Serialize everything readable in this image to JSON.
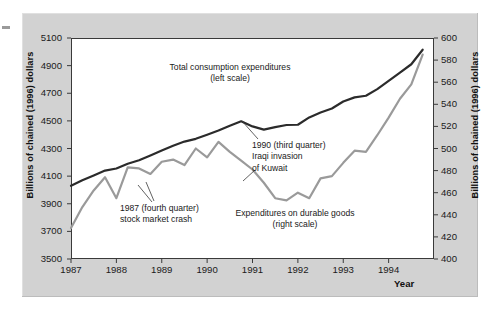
{
  "chart_data": {
    "type": "line",
    "title": "",
    "xlabel": "Year",
    "ylabel_left": "Billions of chained (1996) dollars",
    "ylabel_right": "Billions of chained (1996) dollars",
    "grid": false,
    "legend_position": "inline-annotations",
    "x_tick_labels": [
      "1987",
      "1988",
      "1989",
      "1990",
      "1991",
      "1992",
      "1993",
      "1994"
    ],
    "x_tick_values": [
      1987,
      1988,
      1989,
      1990,
      1991,
      1992,
      1993,
      1994
    ],
    "xlim": [
      1987,
      1995
    ],
    "ylim_left": [
      3500,
      5100
    ],
    "ylim_right": [
      400,
      600
    ],
    "y_ticks_left": [
      3500,
      3700,
      3900,
      4100,
      4300,
      4500,
      4700,
      4900,
      5100
    ],
    "y_ticks_right": [
      400,
      420,
      440,
      460,
      480,
      500,
      520,
      540,
      560,
      580,
      600
    ],
    "series": [
      {
        "name": "Total consumption expenditures",
        "scale": "left",
        "color": "#2b2b2b",
        "width": 2.2,
        "x": [
          1987.0,
          1987.25,
          1987.5,
          1987.75,
          1988.0,
          1988.25,
          1988.5,
          1988.75,
          1989.0,
          1989.25,
          1989.5,
          1989.75,
          1990.0,
          1990.25,
          1990.5,
          1990.75,
          1991.0,
          1991.25,
          1991.5,
          1991.75,
          1992.0,
          1992.25,
          1992.5,
          1992.75,
          1993.0,
          1993.25,
          1993.5,
          1993.75,
          1994.0,
          1994.25,
          1994.5,
          1994.75
        ],
        "values": [
          4030,
          4070,
          4105,
          4140,
          4155,
          4190,
          4215,
          4250,
          4285,
          4320,
          4350,
          4370,
          4400,
          4430,
          4465,
          4497,
          4460,
          4437,
          4455,
          4470,
          4472,
          4525,
          4560,
          4590,
          4640,
          4670,
          4682,
          4730,
          4790,
          4850,
          4910,
          5015
        ]
      },
      {
        "name": "Expenditures on durable goods",
        "scale": "right",
        "color": "#9a9a9a",
        "width": 2.2,
        "x": [
          1987.0,
          1987.25,
          1987.5,
          1987.75,
          1988.0,
          1988.25,
          1988.5,
          1988.75,
          1989.0,
          1989.25,
          1989.5,
          1989.75,
          1990.0,
          1990.25,
          1990.5,
          1990.75,
          1991.0,
          1991.25,
          1991.5,
          1991.75,
          1992.0,
          1992.25,
          1992.5,
          1992.75,
          1993.0,
          1993.25,
          1993.5,
          1993.75,
          1994.0,
          1994.25,
          1994.5,
          1994.75
        ],
        "values": [
          428,
          447,
          462,
          474,
          455,
          483,
          482,
          477,
          488,
          490,
          485,
          500,
          492,
          506,
          497,
          489,
          481,
          469,
          455,
          453,
          460,
          455,
          473,
          475,
          487,
          498,
          497,
          512,
          528,
          545,
          558,
          585
        ]
      }
    ],
    "annotations": [
      {
        "id": "total",
        "text": "Total consumption expenditures\n(left scale)",
        "align": "center"
      },
      {
        "id": "durable",
        "text": "Expenditures on durable goods\n(right scale)",
        "align": "center"
      },
      {
        "id": "iraq",
        "text": "1990 (third quarter)\nIraqi invasion\nof Kuwait",
        "align": "left"
      },
      {
        "id": "crash",
        "text": "1987 (fourth quarter)\nstock market crash",
        "align": "left"
      }
    ]
  },
  "figure": {
    "xtitle": "Year",
    "ytitle_left": "Billions of chained (1996) dollars",
    "ytitle_right": "Billions of chained (1996) dollars",
    "annot_total": "Total consumption expenditures\n(left scale)",
    "annot_durable": "Expenditures on durable goods\n(right scale)",
    "annot_iraq": "1990 (third quarter)\nIraqi invasion\nof Kuwait",
    "annot_crash": "1987 (fourth quarter)\nstock market crash",
    "ytick_left_0": "3500",
    "ytick_left_1": "3700",
    "ytick_left_2": "3900",
    "ytick_left_3": "4100",
    "ytick_left_4": "4300",
    "ytick_left_5": "4500",
    "ytick_left_6": "4700",
    "ytick_left_7": "4900",
    "ytick_left_8": "5100",
    "ytick_right_0": "400",
    "ytick_right_1": "420",
    "ytick_right_2": "440",
    "ytick_right_3": "460",
    "ytick_right_4": "480",
    "ytick_right_5": "500",
    "ytick_right_6": "520",
    "ytick_right_7": "540",
    "ytick_right_8": "560",
    "ytick_right_9": "580",
    "ytick_right_10": "600",
    "xtick_0": "1987",
    "xtick_1": "1988",
    "xtick_2": "1989",
    "xtick_3": "1990",
    "xtick_4": "1991",
    "xtick_5": "1992",
    "xtick_6": "1993",
    "xtick_7": "1994",
    "colors": {
      "page_background": "#ffffff",
      "panel_background": "#d2d2d2",
      "plot_background": "#ffffff",
      "axis": "#3a3a3a",
      "series_total": "#2b2b2b",
      "series_durable": "#9a9a9a",
      "text": "#1a1a1a"
    }
  }
}
